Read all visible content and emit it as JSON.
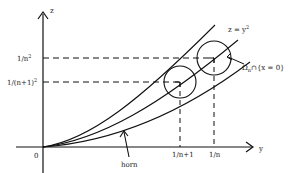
{
  "diagram": {
    "axes": {
      "vertical_label": "z",
      "horizontal_label": "y",
      "origin_label": "0"
    },
    "z_ticks": [
      {
        "base": "1/n",
        "exp": "2"
      },
      {
        "base": "1/(n+1)",
        "exp": "2"
      }
    ],
    "y_ticks": [
      "1/n+1",
      "1/n"
    ],
    "curve_label": {
      "lhs": "z = y",
      "exp": "2"
    },
    "region_label": {
      "omega": "Ω",
      "sub": "n",
      "rest": "∩{x = 0}"
    },
    "horn_label": "horn",
    "colors": {
      "ink": "#111111",
      "background": "#ffffff"
    }
  }
}
